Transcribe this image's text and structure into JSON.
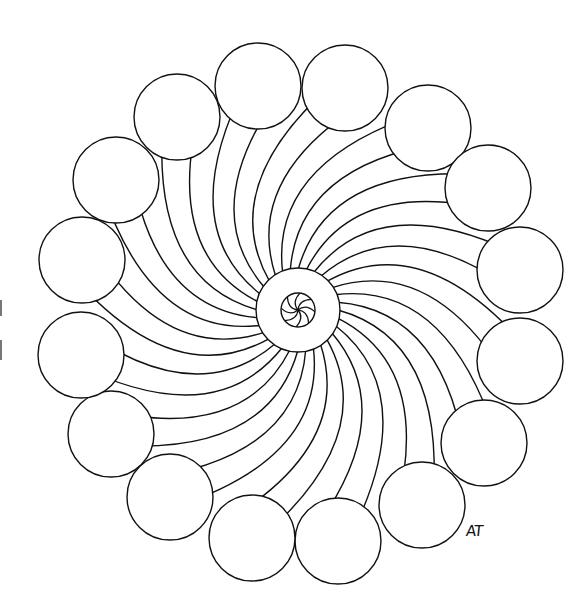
{
  "artwork": {
    "title": "Swirl mandala coloring page",
    "signature": "AT",
    "stroke_color": "#111111",
    "background_color": "#ffffff",
    "center": {
      "x": 298,
      "y": 310
    },
    "center_ring_radius": 42,
    "inner_circle_radius": 17,
    "inner_spoke_count": 8,
    "outer_circle_count": 16,
    "outer_circle_radius": 43,
    "outer_circles": [
      {
        "x": 258,
        "y": 86
      },
      {
        "x": 345,
        "y": 88
      },
      {
        "x": 428,
        "y": 128
      },
      {
        "x": 488,
        "y": 188
      },
      {
        "x": 520,
        "y": 270
      },
      {
        "x": 520,
        "y": 361
      },
      {
        "x": 484,
        "y": 443
      },
      {
        "x": 422,
        "y": 505
      },
      {
        "x": 338,
        "y": 541
      },
      {
        "x": 252,
        "y": 538
      },
      {
        "x": 170,
        "y": 497
      },
      {
        "x": 111,
        "y": 434
      },
      {
        "x": 81,
        "y": 355
      },
      {
        "x": 82,
        "y": 260
      },
      {
        "x": 116,
        "y": 180
      },
      {
        "x": 177,
        "y": 117
      }
    ],
    "spoke_count": 32
  }
}
